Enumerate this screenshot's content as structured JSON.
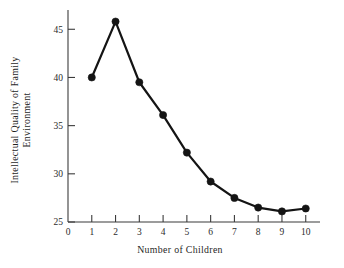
{
  "chart_data": {
    "type": "line",
    "title": "",
    "xlabel": "Number of Children",
    "ylabel": "Intellectual Quality of Family Environment",
    "ylabel_lines": [
      "Intellectual Quality of Family",
      "Environment"
    ],
    "x": [
      1,
      2,
      3,
      4,
      5,
      6,
      7,
      8,
      9,
      10
    ],
    "values": [
      40.0,
      45.8,
      39.5,
      36.1,
      32.2,
      29.2,
      27.5,
      26.5,
      26.1,
      26.4
    ],
    "series": [
      {
        "name": "Intellectual Quality of Family Environment",
        "values": [
          40.0,
          45.8,
          39.5,
          36.1,
          32.2,
          29.2,
          27.5,
          26.5,
          26.1,
          26.4
        ]
      }
    ],
    "xlim": [
      0,
      10.6
    ],
    "ylim": [
      25,
      47
    ],
    "xticks": [
      0,
      1,
      2,
      3,
      4,
      5,
      6,
      7,
      8,
      9,
      10
    ],
    "xtick_labels": [
      "0",
      "1",
      "2",
      "3",
      "4",
      "5",
      "6",
      "7",
      "8",
      "9",
      "10"
    ],
    "yticks": [
      25,
      30,
      35,
      40,
      45
    ],
    "ytick_labels": [
      "25",
      "30",
      "35",
      "40",
      "45"
    ],
    "grid": false,
    "legend": "none",
    "marker": "filled-circle",
    "line_color": "#141414",
    "marker_color": "#141414",
    "axis_color": "#3b3b3b",
    "background_color": "#ffffff"
  }
}
